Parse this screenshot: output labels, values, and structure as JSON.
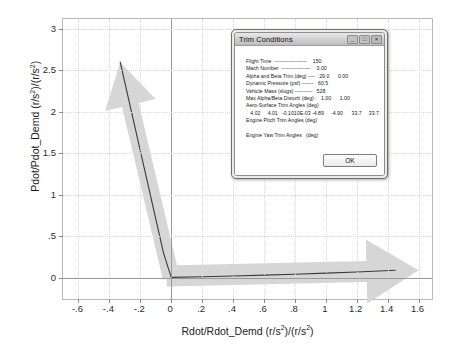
{
  "chart_data": {
    "type": "line",
    "title": "",
    "xlabel": "Rdot/Rdot_Demd (r/s2)/(r/s2)",
    "ylabel": "Pdot/Pdot_Demd (r/s2)/(r/s2)",
    "xlim": [
      -0.7,
      1.7
    ],
    "ylim": [
      -0.28,
      3.12
    ],
    "xticks": [
      "-.6",
      "-.4",
      "-.2",
      "0",
      ".2",
      ".4",
      ".6",
      ".8",
      "1",
      "1.2",
      "1.4",
      "1.6"
    ],
    "xtick_values": [
      -0.6,
      -0.4,
      -0.2,
      0,
      0.2,
      0.4,
      0.6,
      0.8,
      1.0,
      1.2,
      1.4,
      1.6
    ],
    "yticks": [
      "0",
      ".5",
      "1",
      "1.5",
      "2",
      "2.5",
      "3"
    ],
    "ytick_values": [
      0,
      0.5,
      1.0,
      1.5,
      2.0,
      2.5,
      3.0
    ],
    "grid": true,
    "legend": "none",
    "series": [
      {
        "name": "response-curve",
        "color": "#3a3a3a",
        "x": [
          -0.33,
          -0.05,
          0.0,
          0.2,
          0.4,
          0.6,
          0.8,
          1.0,
          1.2,
          1.45
        ],
        "y": [
          2.6,
          0.3,
          0.005,
          0.013,
          0.022,
          0.032,
          0.043,
          0.056,
          0.07,
          0.09
        ]
      }
    ],
    "annotations": [
      {
        "name": "up-arrow",
        "shape": "block-arrow",
        "color": "#d6d6d6",
        "direction": "up-left",
        "from_x": 0.0,
        "from_y": 0.0,
        "to_x": -0.33,
        "to_y": 2.6
      },
      {
        "name": "right-arrow",
        "shape": "block-arrow",
        "color": "#d6d6d6",
        "direction": "right",
        "from_x": -0.03,
        "from_y": 0.02,
        "to_x": 1.6,
        "to_y": 0.09
      }
    ]
  },
  "axis": {
    "x_label_main": "Rdot/Rdot_Demd (r/s",
    "x_label_sup1": "2",
    "x_label_mid": ")/(r/s",
    "x_label_sup2": "2",
    "x_label_end": ")",
    "y_label_main": "Pdot/Pdot_Demd (r/s",
    "y_label_sup1": "2",
    "y_label_mid": ")/(r/s",
    "y_label_sup2": "2",
    "y_label_end": ")"
  },
  "dialog": {
    "title": "Trim Conditions",
    "window_buttons": [
      {
        "name": "minimize",
        "glyph": "_"
      },
      {
        "name": "maximize",
        "glyph": "□"
      },
      {
        "name": "close",
        "glyph": "×"
      }
    ],
    "lines": [
      "Flight Time  -------------------    150.",
      "Mach Number  -----------------    3.00",
      "Alpha and Beta Trim (deg) ----   29.0      0.00",
      "Dynamic Pressure (psf) -------   60.5",
      "Vehicle Mass (slugs) ----------   528.",
      "Max Alpha/Beta Disturb (deg) :   1.00      1.00",
      "Aero-Surface Trim Angles (deg)",
      "   4.02     4.01   -0.1010E-03 -4.89     -4.90      33.7     33.7",
      "Engine Pitch Trim Angles (deg)",
      "",
      "Engine Yaw Trim Angles   (deg)"
    ],
    "ok_label": "OK"
  }
}
